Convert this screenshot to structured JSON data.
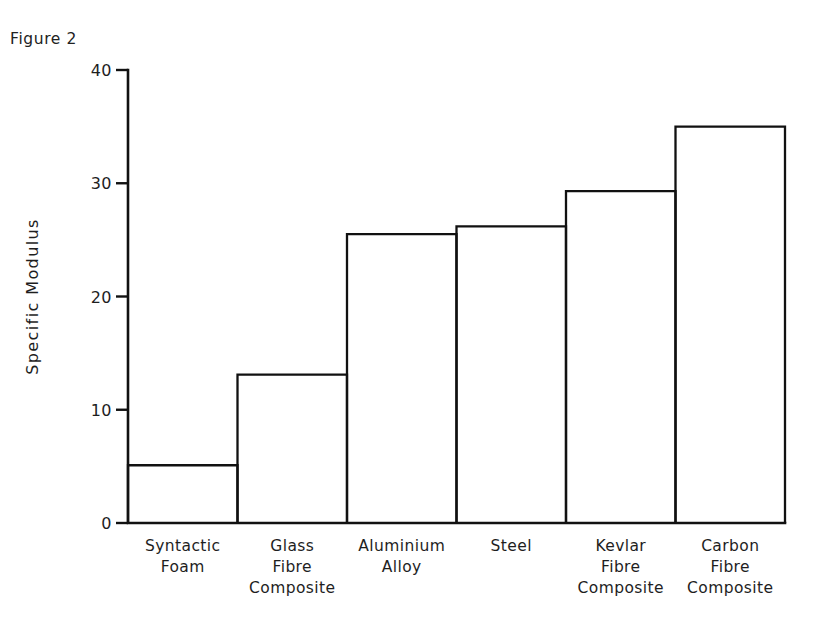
{
  "figure": {
    "title": "Figure 2"
  },
  "chart_data": {
    "type": "bar",
    "title": "Figure 2",
    "xlabel": "",
    "ylabel": "Specific Modulus",
    "categories": [
      "Syntactic Foam",
      "Glass Fibre Composite",
      "Aluminium Alloy",
      "Steel",
      "Kevlar Fibre Composite",
      "Carbon Fibre Composite"
    ],
    "category_lines": [
      [
        "Syntactic",
        "Foam"
      ],
      [
        "Glass",
        "Fibre",
        "Composite"
      ],
      [
        "Aluminium",
        "Alloy"
      ],
      [
        "Steel"
      ],
      [
        "Kevlar",
        "Fibre",
        "Composite"
      ],
      [
        "Carbon",
        "Fibre",
        "Composite"
      ]
    ],
    "values": [
      5.1,
      13.1,
      25.5,
      26.2,
      29.3,
      35.0
    ],
    "ylim": [
      0,
      40
    ],
    "yticks": [
      0,
      10,
      20,
      30,
      40
    ],
    "ytick_labels": [
      "0",
      "10",
      "20",
      "30",
      "40"
    ],
    "grid": false,
    "legend": false,
    "bar_style": "open-outline",
    "bar_gap": 0,
    "colors": {
      "background": "#ffffff",
      "outline": "#111111",
      "text": "#1e1e1e"
    }
  },
  "layout": {
    "plot_left": 128,
    "plot_right": 785,
    "baseline_y": 523,
    "top_y": 70,
    "title_x": 10,
    "title_y": 44,
    "axis_title_x": 38,
    "tick_label_x": 112,
    "tick_len": 12,
    "cat_label_start_y": 551,
    "cat_line_height": 21
  }
}
